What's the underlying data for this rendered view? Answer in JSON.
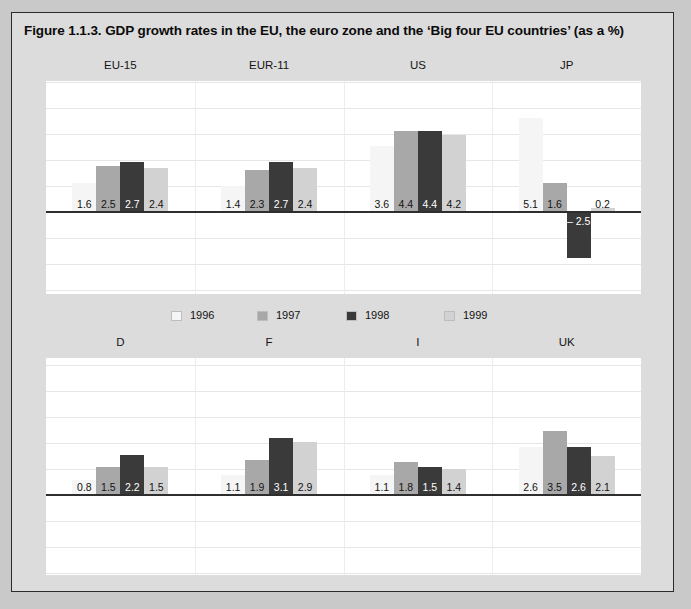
{
  "figure": {
    "title": "Figure 1.1.3. GDP growth rates in the EU, the euro zone and the ‘Big four EU countries’ (as a %)"
  },
  "legend": {
    "items": [
      {
        "label": "1996",
        "color": "#f5f5f5"
      },
      {
        "label": "1997",
        "color": "#a8a8a8"
      },
      {
        "label": "1998",
        "color": "#3a3a3a"
      },
      {
        "label": "1999",
        "color": "#d2d2d2"
      }
    ]
  },
  "chart_data": {
    "type": "bar",
    "title": "Figure 1.1.3. GDP growth rates in the EU, the euro zone and the ‘Big four EU countries’ (as a %)",
    "xlabel": "",
    "ylabel": "GDP growth rate (%)",
    "unit": "%",
    "grid": true,
    "legend_position": "center-middle",
    "series": [
      {
        "name": "1996",
        "color": "#f5f5f5"
      },
      {
        "name": "1997",
        "color": "#a8a8a8"
      },
      {
        "name": "1998",
        "color": "#3a3a3a"
      },
      {
        "name": "1999",
        "color": "#d2d2d2"
      }
    ],
    "panels": [
      {
        "name": "top",
        "categories": [
          "EU-15",
          "EUR-11",
          "US",
          "JP"
        ],
        "ylim": [
          -3.5,
          5.6
        ],
        "groups": [
          {
            "category": "EU-15",
            "values": [
              1.6,
              2.5,
              2.7,
              2.4
            ],
            "labels": [
              "1.6",
              "2.5",
              "2.7",
              "2.4"
            ]
          },
          {
            "category": "EUR-11",
            "values": [
              1.4,
              2.3,
              2.7,
              2.4
            ],
            "labels": [
              "1.4",
              "2.3",
              "2.7",
              "2.4"
            ]
          },
          {
            "category": "US",
            "values": [
              3.6,
              4.4,
              4.4,
              4.2
            ],
            "labels": [
              "3.6",
              "4.4",
              "4.4",
              "4.2"
            ]
          },
          {
            "category": "JP",
            "values": [
              5.1,
              1.6,
              -2.5,
              0.2
            ],
            "labels": [
              "5.1",
              "1.6",
              "– 2.5",
              "0.2"
            ]
          }
        ]
      },
      {
        "name": "bottom",
        "categories": [
          "D",
          "F",
          "I",
          "UK"
        ],
        "ylim": [
          -3.5,
          5.6
        ],
        "groups": [
          {
            "category": "D",
            "values": [
              0.8,
              1.5,
              2.2,
              1.5
            ],
            "labels": [
              "0.8",
              "1.5",
              "2.2",
              "1.5"
            ]
          },
          {
            "category": "F",
            "values": [
              1.1,
              1.9,
              3.1,
              2.9
            ],
            "labels": [
              "1.1",
              "1.9",
              "3.1",
              "2.9"
            ]
          },
          {
            "category": "I",
            "values": [
              1.1,
              1.8,
              1.5,
              1.4
            ],
            "labels": [
              "1.1",
              "1.8",
              "1.5",
              "1.4"
            ]
          },
          {
            "category": "UK",
            "values": [
              2.6,
              3.5,
              2.6,
              2.1
            ],
            "labels": [
              "2.6",
              "3.5",
              "2.6",
              "2.1"
            ]
          }
        ]
      }
    ]
  }
}
